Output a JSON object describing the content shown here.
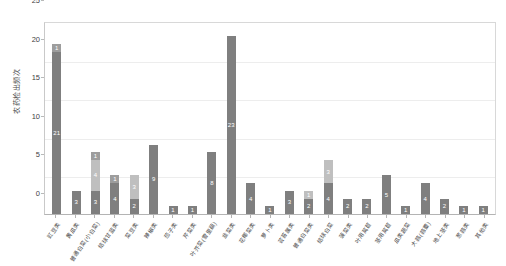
{
  "title_ghost": "",
  "chart_data": {
    "type": "bar",
    "stacked": true,
    "title": "",
    "xlabel": "",
    "ylabel": "农药检出频次",
    "ylim": [
      0,
      25
    ],
    "yticks": [
      0,
      5,
      10,
      15,
      20,
      25
    ],
    "grid": true,
    "legend": "none",
    "categories": [
      "豇豆类",
      "黄瓜类",
      "普通白菜(小白菜)",
      "结球甘蓝类",
      "菜豆类",
      "辣椒类",
      "茄子类",
      "芹菜类",
      "叶芥菜(雪里蕻)",
      "韭菜类",
      "花椰菜类",
      "萝卜类",
      "芸苔属类",
      "普通白菜类",
      "结球白菜",
      "菠菜类",
      "叶用莴苣",
      "茎用莴苣",
      "瓜类蔬菜",
      "大蒜(蒜薹)",
      "地上茎类",
      "葱蒜类",
      "其他类"
    ],
    "series": [
      {
        "name": "第一层",
        "values": [
          21,
          3,
          3,
          4,
          2,
          9,
          1,
          1,
          8,
          23,
          4,
          1,
          3,
          2,
          4,
          2,
          2,
          5,
          1,
          4,
          2,
          1,
          1
        ]
      },
      {
        "name": "第二层",
        "values": [
          0,
          0,
          4,
          0,
          3,
          0,
          0,
          0,
          0,
          0,
          0,
          0,
          0,
          1,
          3,
          0,
          0,
          0,
          0,
          0,
          0,
          0,
          0
        ]
      },
      {
        "name": "第三层",
        "values": [
          1,
          0,
          1,
          1,
          0,
          0,
          0,
          0,
          0,
          0,
          0,
          0,
          0,
          0,
          0,
          0,
          0,
          0,
          0,
          0,
          0,
          0,
          0
        ]
      }
    ],
    "totals": [
      22,
      3,
      8,
      5,
      5,
      9,
      1,
      1,
      8,
      23,
      4,
      1,
      3,
      3,
      7,
      2,
      2,
      5,
      1,
      4,
      2,
      1,
      1
    ],
    "colors": {
      "series_0": "#7f7f7f",
      "series_1": "#bfbfbf",
      "series_2": "#9d9d9d",
      "axis": "#b4b4b4",
      "grid": "#ededed",
      "text": "#3f3f3f",
      "background": "#ffffff"
    }
  }
}
